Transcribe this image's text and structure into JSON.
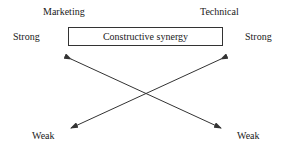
{
  "diagram": {
    "top_labels": {
      "left": "Marketing",
      "right": "Technical"
    },
    "strong_labels": {
      "left": "Strong",
      "right": "Strong"
    },
    "weak_labels": {
      "left": "Weak",
      "right": "Weak"
    },
    "box_label": "Constructive synergy",
    "arrows": [
      {
        "from": "bottom-right",
        "to": "top-left",
        "color": "#333333"
      },
      {
        "from": "top-left",
        "to": "bottom-right",
        "color": "#333333"
      },
      {
        "from": "bottom-left",
        "to": "top-right",
        "color": "#333333"
      },
      {
        "from": "top-right",
        "to": "bottom-left",
        "color": "#333333"
      }
    ]
  }
}
